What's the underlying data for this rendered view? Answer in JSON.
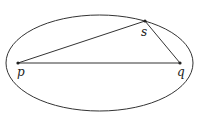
{
  "diagram": {
    "ellipse": {
      "cx": 99.5,
      "cy": 63,
      "rx": 93.5,
      "ry": 48,
      "stroke": "#333333"
    },
    "points": [
      {
        "id": "p",
        "label": "p",
        "x": 18,
        "y": 63,
        "lx": 17,
        "ly": 76
      },
      {
        "id": "q",
        "label": "q",
        "x": 180,
        "y": 63,
        "lx": 177,
        "ly": 76
      },
      {
        "id": "s",
        "label": "s",
        "x": 145,
        "y": 21,
        "lx": 141,
        "ly": 36
      }
    ],
    "segments": [
      [
        "p",
        "s"
      ],
      [
        "s",
        "q"
      ],
      [
        "p",
        "q"
      ]
    ]
  }
}
